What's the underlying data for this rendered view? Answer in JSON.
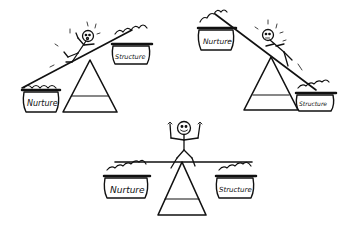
{
  "illustration": {
    "description": "Three hand-drawn seesaw balances weighing Nurture against Structure",
    "scenes": [
      {
        "id": "scene-nurture-heavy",
        "left_pot": {
          "label": "Nurture",
          "position": "low"
        },
        "right_pot": {
          "label": "Structure",
          "position": "high"
        },
        "figure_mood": "alarmed, sliding"
      },
      {
        "id": "scene-structure-heavy",
        "left_pot": {
          "label": "Nurture",
          "position": "high"
        },
        "right_pot": {
          "label": "Structure",
          "position": "low"
        },
        "figure_mood": "alarmed, sliding"
      },
      {
        "id": "scene-balanced",
        "left_pot": {
          "label": "Nurture",
          "position": "level"
        },
        "right_pot": {
          "label": "Structure",
          "position": "level"
        },
        "figure_mood": "happy, arms raised"
      }
    ],
    "colors": {
      "ink": "#111111",
      "background": "#ffffff",
      "pot_band": "#222222"
    }
  }
}
